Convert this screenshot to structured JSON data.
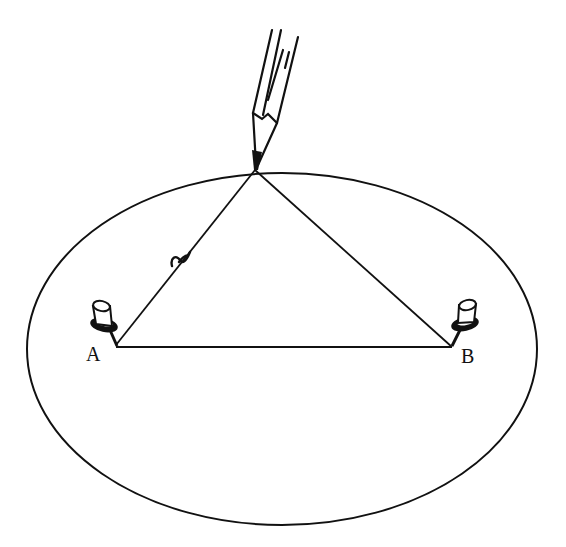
{
  "figure": {
    "colors": {
      "ink": "#111111",
      "background": "#ffffff"
    },
    "ellipse": {
      "cx": 282,
      "cy": 349,
      "rx": 255,
      "ry": 176
    },
    "pencil_tip": {
      "x": 255,
      "y": 170
    },
    "foci": [
      {
        "id": "A",
        "label": "A",
        "x": 116,
        "y": 345
      },
      {
        "id": "B",
        "label": "B",
        "x": 452,
        "y": 347
      }
    ],
    "string": {
      "segments": [
        "A-tip",
        "tip-B",
        "A-B"
      ],
      "knot_position": {
        "x": 178,
        "y": 256
      }
    }
  }
}
